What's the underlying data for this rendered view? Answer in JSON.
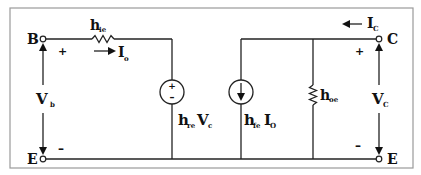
{
  "diagram": {
    "terminals": {
      "base": "B",
      "emitter_left": "E",
      "collector": "C",
      "emitter_right": "E"
    },
    "input": {
      "resistor_label": "h",
      "resistor_sub": "ie",
      "current_label": "I",
      "current_sub": "o",
      "voltage_label": "V",
      "voltage_sub": "b",
      "plus": "+",
      "minus": "–"
    },
    "vsource": {
      "label_h": "h",
      "label_h_sub": "re",
      "label_v": "V",
      "label_v_sub": "c",
      "plus": "+",
      "minus": "–"
    },
    "isource": {
      "label_h": "h",
      "label_h_sub": "fe",
      "label_i": "I",
      "label_i_sub": "O"
    },
    "output": {
      "resistor_label": "h",
      "resistor_sub": "oe",
      "current_label": "I",
      "current_sub": "C",
      "voltage_label": "V",
      "voltage_sub": "C",
      "plus": "+",
      "minus": "–"
    },
    "colors": {
      "line": "#222222",
      "border": "#9a9a9a",
      "background": "#ffffff"
    }
  }
}
